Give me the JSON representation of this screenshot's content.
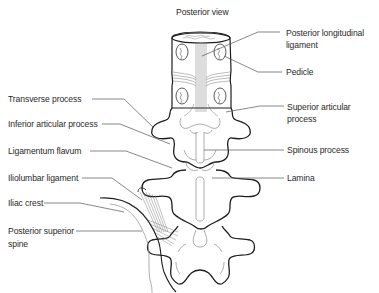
{
  "title": "Posterior view",
  "labels_right": {
    "posterior_longitudinal_ligament_line1": "Posterior longitudinal",
    "posterior_longitudinal_ligament_line2": "ligament",
    "pedicle": "Pedicle",
    "superior_articular_process_line1": "Superior articular",
    "superior_articular_process_line2": "process",
    "spinous_process": "Spinous process",
    "lamina": "Lamina"
  },
  "labels_left": {
    "transverse_process": "Transverse process",
    "inferior_articular_process": "Inferior articular process",
    "ligamentum_flavum": "Ligamentum flavum",
    "iliolumbar_ligament": "Iliolumbar ligament",
    "iliac_crest": "Iliac crest",
    "posterior_superior_spine_line1": "Posterior superior",
    "posterior_superior_spine_line2": "spine"
  },
  "colors": {
    "outline": "#1e1e1e",
    "fine_line": "#8a8a8a",
    "leader_line": "#555555",
    "text": "#2a2a2a"
  }
}
